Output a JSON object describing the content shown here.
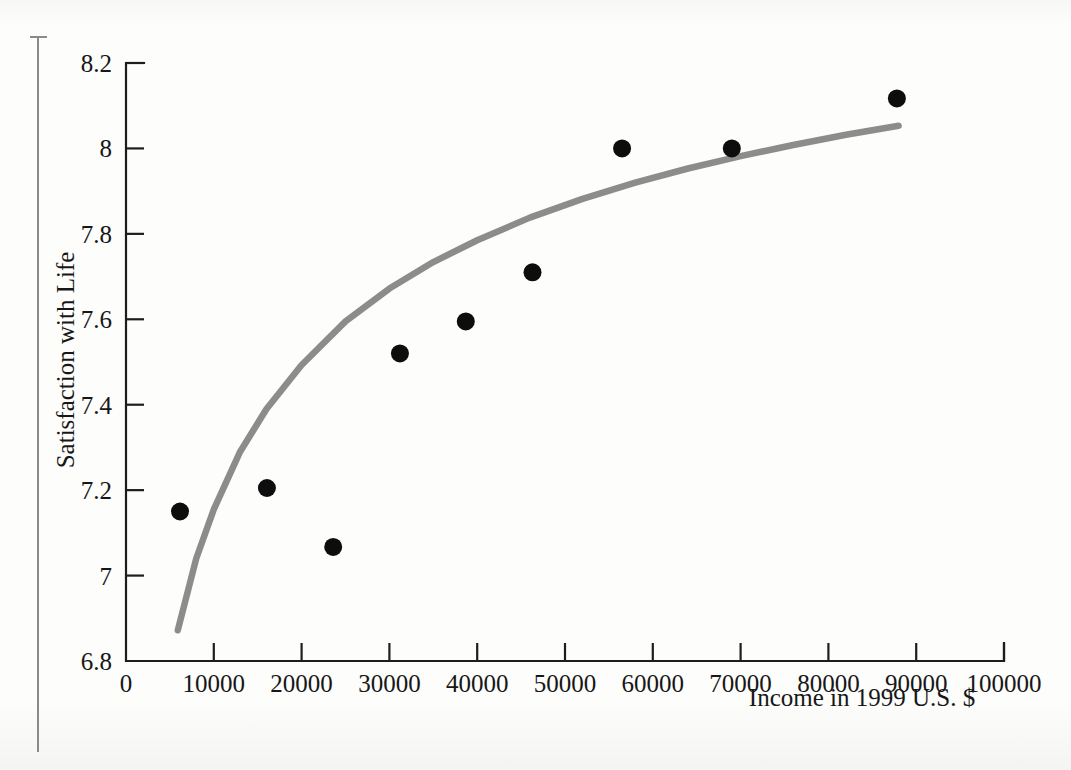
{
  "figure": {
    "background_color": "#fdfdfc",
    "margin_rule_color": "#8a8a8a"
  },
  "chart_data": {
    "type": "scatter",
    "title": "",
    "xlabel": "Income in 1999 U.S. $",
    "ylabel": "Satisfaction with Life",
    "xlim": [
      0,
      100000
    ],
    "ylim": [
      6.8,
      8.2
    ],
    "xticks": [
      0,
      10000,
      20000,
      30000,
      40000,
      50000,
      60000,
      70000,
      80000,
      90000,
      100000
    ],
    "xtick_labels": [
      "0",
      "10000",
      "20000",
      "30000",
      "40000",
      "50000",
      "60000",
      "70000",
      "80000",
      "90000",
      "100000"
    ],
    "yticks": [
      6.8,
      7,
      7.2,
      7.4,
      7.6,
      7.8,
      8,
      8.2
    ],
    "ytick_labels": [
      "6.8",
      "7",
      "7.2",
      "7.4",
      "7.6",
      "7.8",
      "8",
      "8.2"
    ],
    "grid": false,
    "legend": false,
    "legend_position": "none",
    "point_color": "#0d0d0d",
    "point_radius": 9,
    "series": [
      {
        "name": "Income vs. satisfaction",
        "type": "scatter",
        "x": [
          6150,
          16050,
          23600,
          31200,
          38700,
          46300,
          56500,
          69000,
          87800
        ],
        "y": [
          7.15,
          7.205,
          7.067,
          7.52,
          7.595,
          7.71,
          8.0,
          8.0,
          8.117
        ]
      },
      {
        "name": "Logarithmic fit",
        "type": "line",
        "color": "#8c8c8c",
        "line_width": 6.5,
        "x": [
          5900,
          8000,
          10000,
          13000,
          16000,
          20000,
          25000,
          30000,
          35000,
          40000,
          46000,
          52000,
          58000,
          64000,
          70000,
          76000,
          82000,
          88000
        ],
        "y": [
          6.872,
          7.04,
          7.155,
          7.29,
          7.39,
          7.493,
          7.595,
          7.672,
          7.734,
          7.785,
          7.838,
          7.882,
          7.92,
          7.953,
          7.982,
          8.008,
          8.032,
          8.053
        ]
      }
    ]
  }
}
